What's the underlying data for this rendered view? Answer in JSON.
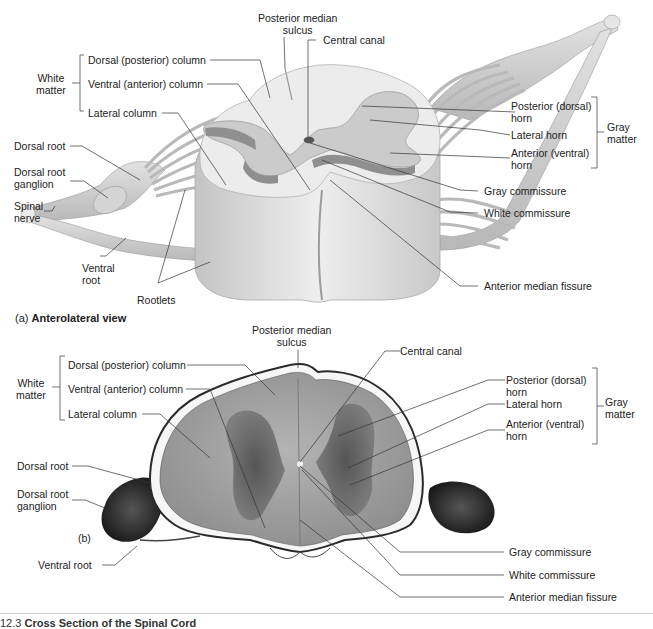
{
  "figure": {
    "caption_number": "12.3",
    "caption_title": "Cross Section of the Spinal Cord"
  },
  "panel_a": {
    "letter": "(a)",
    "title": "Anterolateral view",
    "labels": {
      "posterior_median_sulcus_1": "Posterior median",
      "posterior_median_sulcus_2": "sulcus",
      "central_canal": "Central canal",
      "white_matter_1": "White",
      "white_matter_2": "matter",
      "dorsal_column": "Dorsal (posterior) column",
      "ventral_column": "Ventral (anterior) column",
      "lateral_column": "Lateral column",
      "dorsal_root": "Dorsal root",
      "drg_1": "Dorsal root",
      "drg_2": "ganglion",
      "spinal_nerve_1": "Spinal",
      "spinal_nerve_2": "nerve",
      "ventral_root_1": "Ventral",
      "ventral_root_2": "root",
      "rootlets": "Rootlets",
      "posterior_horn_1": "Posterior (dorsal)",
      "posterior_horn_2": "horn",
      "lateral_horn": "Lateral horn",
      "anterior_horn_1": "Anterior (ventral)",
      "anterior_horn_2": "horn",
      "gray_matter_1": "Gray",
      "gray_matter_2": "matter",
      "gray_commissure": "Gray commissure",
      "white_commissure": "White commissure",
      "anterior_median_fissure": "Anterior median fissure"
    }
  },
  "panel_b": {
    "letter": "(b)",
    "labels": {
      "posterior_median_sulcus_1": "Posterior median",
      "posterior_median_sulcus_2": "sulcus",
      "central_canal": "Central canal",
      "white_matter_1": "White",
      "white_matter_2": "matter",
      "dorsal_column": "Dorsal (posterior) column",
      "ventral_column": "Ventral (anterior) column",
      "lateral_column": "Lateral column",
      "dorsal_root": "Dorsal root",
      "drg_1": "Dorsal root",
      "drg_2": "ganglion",
      "ventral_root": "Ventral root",
      "posterior_horn_1": "Posterior (dorsal)",
      "posterior_horn_2": "horn",
      "lateral_horn": "Lateral horn",
      "anterior_horn_1": "Anterior (ventral)",
      "anterior_horn_2": "horn",
      "gray_matter_1": "Gray",
      "gray_matter_2": "matter",
      "gray_commissure": "Gray commissure",
      "white_commissure": "White commissure",
      "anterior_median_fissure": "Anterior median fissure"
    }
  },
  "colors": {
    "white_matter": "#e9e9e9",
    "gray_matter": "#c9c9c9",
    "cord_side": "#d6d6d6",
    "nerve": "#cfcfcf",
    "leader_line": "#333333",
    "tissue_dark": "#3a3a3a",
    "tissue_mid": "#8a8a8a"
  }
}
